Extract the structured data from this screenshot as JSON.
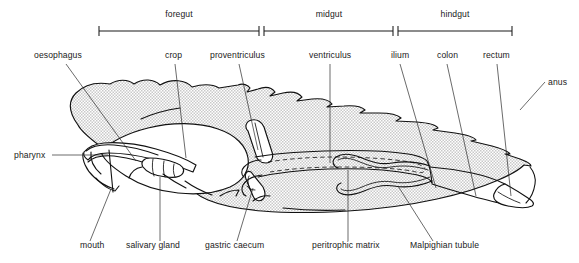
{
  "figure": {
    "background_color": "#ffffff",
    "line_color": "#111111",
    "fill_pattern": "stipple-gray",
    "fill_color": "#d9d9d9"
  },
  "regions": [
    {
      "label": "foregut",
      "x1": 99,
      "x2": 259,
      "text_x": 179,
      "text_y": 17
    },
    {
      "label": "midgut",
      "x1": 264,
      "x2": 393,
      "text_x": 329,
      "text_y": 17
    },
    {
      "label": "hindgut",
      "x1": 398,
      "x2": 512,
      "text_x": 455,
      "text_y": 17
    }
  ],
  "labels_top": [
    {
      "name": "oesophagus",
      "text": "oesophagus",
      "text_x": 34,
      "text_y": 58,
      "anchor": "start"
    },
    {
      "name": "crop",
      "text": "crop",
      "text_x": 165,
      "text_y": 58,
      "anchor": "start"
    },
    {
      "name": "proventriculus",
      "text": "proventriculus",
      "text_x": 210,
      "text_y": 58,
      "anchor": "start"
    },
    {
      "name": "ventriculus",
      "text": "ventriculus",
      "text_x": 309,
      "text_y": 58,
      "anchor": "start"
    },
    {
      "name": "ilium",
      "text": "ilium",
      "text_x": 391,
      "text_y": 58,
      "anchor": "start"
    },
    {
      "name": "colon",
      "text": "colon",
      "text_x": 437,
      "text_y": 58,
      "anchor": "start"
    },
    {
      "name": "rectum",
      "text": "rectum",
      "text_x": 483,
      "text_y": 58,
      "anchor": "start"
    },
    {
      "name": "anus",
      "text": "anus",
      "text_x": 548,
      "text_y": 85,
      "anchor": "start"
    }
  ],
  "labels_side": [
    {
      "name": "pharynx",
      "text": "pharynx",
      "text_x": 14,
      "text_y": 158,
      "anchor": "start"
    }
  ],
  "labels_bottom": [
    {
      "name": "mouth",
      "text": "mouth",
      "text_x": 80,
      "text_y": 248,
      "anchor": "start"
    },
    {
      "name": "salivary-gland",
      "text": "salivary gland",
      "text_x": 126,
      "text_y": 248,
      "anchor": "start"
    },
    {
      "name": "gastric-caecum",
      "text": "gastric caecum",
      "text_x": 205,
      "text_y": 248,
      "anchor": "start"
    },
    {
      "name": "peritrophic-matrix",
      "text": "peritrophic matrix",
      "text_x": 312,
      "text_y": 248,
      "anchor": "start"
    },
    {
      "name": "Malpighian-tubule",
      "text": "Malpighian tubule",
      "text_x": 410,
      "text_y": 248,
      "anchor": "start"
    }
  ]
}
